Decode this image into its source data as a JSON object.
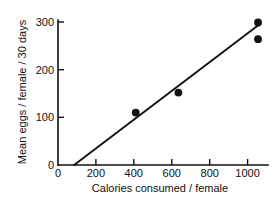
{
  "chart_data": {
    "type": "scatter",
    "title": "",
    "xlabel": "Calories consumed / female",
    "ylabel": "Mean eggs / female / 30 days",
    "xlim": [
      0,
      1130
    ],
    "ylim": [
      0,
      312
    ],
    "grid": false,
    "legend": null,
    "x_ticks": [
      {
        "value": 0,
        "label": "0"
      },
      {
        "value": 200,
        "label": "200"
      },
      {
        "value": 400,
        "label": "400"
      },
      {
        "value": 600,
        "label": "600"
      },
      {
        "value": 800,
        "label": "800"
      },
      {
        "value": 1000,
        "label": "1000"
      }
    ],
    "y_ticks": [
      {
        "value": 0,
        "label": "0"
      },
      {
        "value": 100,
        "label": "100"
      },
      {
        "value": 200,
        "label": "200"
      },
      {
        "value": 300,
        "label": "300"
      }
    ],
    "series": [
      {
        "name": "observations",
        "type": "scatter",
        "marker": "filled-circle",
        "color": "#121212",
        "points": [
          {
            "x": 410,
            "y": 110
          },
          {
            "x": 635,
            "y": 152
          },
          {
            "x": 1055,
            "y": 299
          },
          {
            "x": 1055,
            "y": 264
          }
        ]
      },
      {
        "name": "regression-line",
        "type": "line",
        "color": "#111111",
        "points": [
          {
            "x": 85,
            "y": 0
          },
          {
            "x": 1065,
            "y": 296
          }
        ]
      }
    ]
  }
}
